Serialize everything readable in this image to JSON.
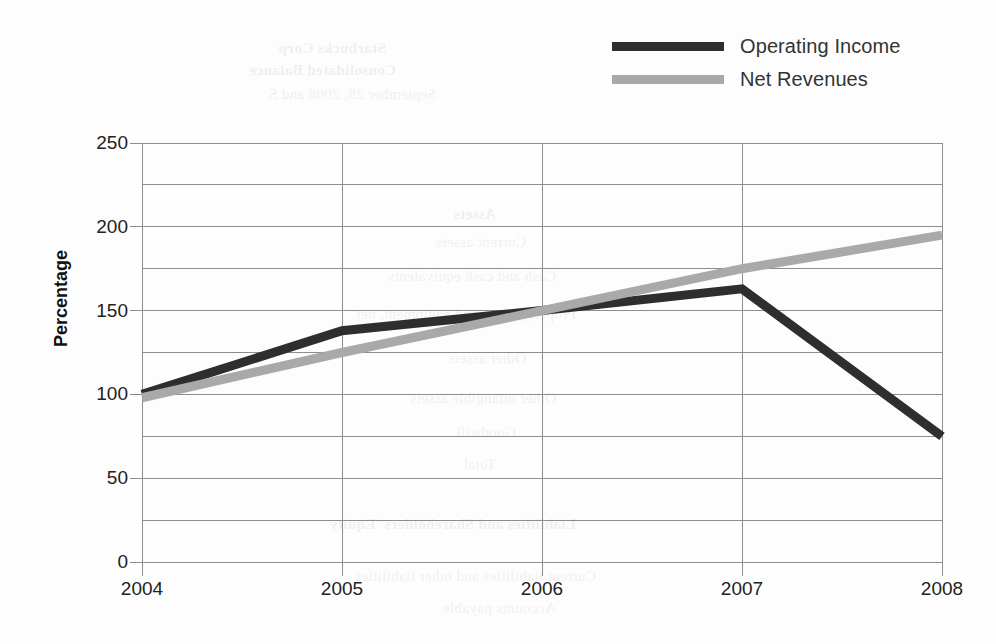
{
  "chart_data": {
    "type": "line",
    "title": "",
    "xlabel": "",
    "ylabel": "Percentage",
    "categories": [
      "2004",
      "2005",
      "2006",
      "2007",
      "2008"
    ],
    "x": [
      2004,
      2005,
      2006,
      2007,
      2008
    ],
    "series": [
      {
        "name": "Operating Income",
        "color": "#2e2e2e",
        "values": [
          100,
          138,
          150,
          163,
          75
        ]
      },
      {
        "name": "Net Revenues",
        "color": "#a9a9a9",
        "values": [
          98,
          125,
          150,
          175,
          195
        ]
      }
    ],
    "ylim": [
      0,
      250
    ],
    "yticks": [
      0,
      50,
      100,
      150,
      200,
      250
    ],
    "ytick_labels": [
      "0",
      "50",
      "100",
      "150",
      "200",
      "250"
    ],
    "minor_ytick_step": 25,
    "grid": "horizontal-and-vertical",
    "legend_position": "top-right"
  },
  "legend": {
    "items": [
      {
        "label": "Operating Income",
        "color": "#2e2e2e"
      },
      {
        "label": "Net Revenues",
        "color": "#a9a9a9"
      }
    ]
  },
  "axes": {
    "y_title": "Percentage",
    "y_labels": [
      "250",
      "200",
      "150",
      "100",
      "50",
      "0"
    ],
    "x_labels": [
      "2004",
      "2005",
      "2006",
      "2007",
      "2008"
    ]
  },
  "watermark": {
    "lines": [
      "Starbucks Corp",
      "Consolidated Balance",
      "September 28, 2008 and S",
      "Assets",
      "Current assets",
      "Cash and cash equivalents",
      "Property, plant and equipment, net",
      "Other assets",
      "Other intangible assets",
      "Goodwill",
      "Total",
      "Liabilities and Shareholders' Equity",
      "Current liabilities and other liabilities",
      "Accounts payable"
    ]
  },
  "colors": {
    "grid": "#8d8d8d",
    "text": "#222222",
    "background": "#fdfdfd"
  }
}
